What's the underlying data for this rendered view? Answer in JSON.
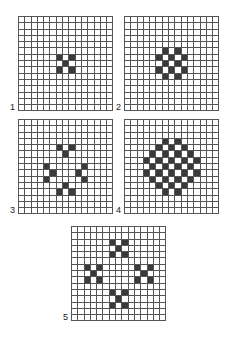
{
  "figure": {
    "grid_size": 15,
    "colors": {
      "filled": "#3a3a3a",
      "empty": "#ffffff",
      "line": "#555555"
    },
    "panels": [
      {
        "label": "1",
        "x": 18,
        "y": 16,
        "label_x": 10,
        "label_y": 103,
        "filled": [
          [
            6,
            6
          ],
          [
            6,
            8
          ],
          [
            7,
            7
          ],
          [
            8,
            6
          ],
          [
            8,
            8
          ]
        ]
      },
      {
        "label": "2",
        "x": 124,
        "y": 16,
        "label_x": 116,
        "label_y": 103,
        "filled": [
          [
            5,
            6
          ],
          [
            5,
            8
          ],
          [
            6,
            5
          ],
          [
            6,
            7
          ],
          [
            6,
            9
          ],
          [
            7,
            6
          ],
          [
            7,
            8
          ],
          [
            8,
            5
          ],
          [
            8,
            7
          ],
          [
            8,
            9
          ],
          [
            9,
            6
          ],
          [
            9,
            8
          ]
        ]
      },
      {
        "label": "3",
        "x": 18,
        "y": 119,
        "label_x": 10,
        "label_y": 206,
        "filled": [
          [
            4,
            6
          ],
          [
            4,
            8
          ],
          [
            5,
            7
          ],
          [
            7,
            4
          ],
          [
            8,
            5
          ],
          [
            9,
            4
          ],
          [
            7,
            10
          ],
          [
            8,
            9
          ],
          [
            9,
            10
          ],
          [
            10,
            7
          ],
          [
            11,
            6
          ],
          [
            11,
            8
          ]
        ]
      },
      {
        "label": "4",
        "x": 124,
        "y": 119,
        "label_x": 116,
        "label_y": 206,
        "filled": [
          [
            3,
            6
          ],
          [
            3,
            8
          ],
          [
            4,
            5
          ],
          [
            4,
            7
          ],
          [
            4,
            9
          ],
          [
            5,
            4
          ],
          [
            5,
            6
          ],
          [
            5,
            8
          ],
          [
            5,
            10
          ],
          [
            6,
            3
          ],
          [
            6,
            5
          ],
          [
            6,
            7
          ],
          [
            6,
            9
          ],
          [
            6,
            11
          ],
          [
            7,
            4
          ],
          [
            7,
            6
          ],
          [
            7,
            8
          ],
          [
            7,
            10
          ],
          [
            8,
            3
          ],
          [
            8,
            5
          ],
          [
            8,
            7
          ],
          [
            8,
            9
          ],
          [
            8,
            11
          ],
          [
            9,
            4
          ],
          [
            9,
            6
          ],
          [
            9,
            8
          ],
          [
            9,
            10
          ],
          [
            10,
            5
          ],
          [
            10,
            7
          ],
          [
            10,
            9
          ],
          [
            11,
            6
          ],
          [
            11,
            8
          ]
        ]
      },
      {
        "label": "5",
        "x": 71,
        "y": 226,
        "label_x": 63,
        "label_y": 313,
        "filled": [
          [
            2,
            6
          ],
          [
            2,
            8
          ],
          [
            3,
            7
          ],
          [
            4,
            6
          ],
          [
            4,
            8
          ],
          [
            6,
            2
          ],
          [
            6,
            4
          ],
          [
            7,
            3
          ],
          [
            8,
            2
          ],
          [
            8,
            4
          ],
          [
            6,
            10
          ],
          [
            6,
            12
          ],
          [
            7,
            11
          ],
          [
            8,
            10
          ],
          [
            8,
            12
          ],
          [
            10,
            6
          ],
          [
            10,
            8
          ],
          [
            11,
            7
          ],
          [
            12,
            6
          ],
          [
            12,
            8
          ]
        ]
      }
    ]
  }
}
